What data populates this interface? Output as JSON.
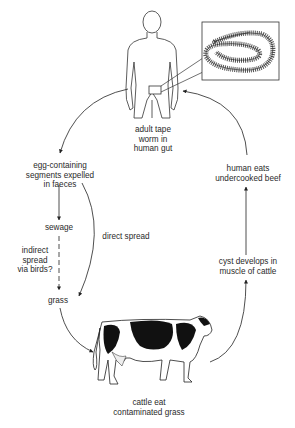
{
  "diagram": {
    "nodes": {
      "adult": {
        "lines": [
          "adult tape",
          "worm in",
          "human gut"
        ]
      },
      "segments": {
        "lines": [
          "egg-containing",
          "segments expelled",
          "in faeces"
        ]
      },
      "sewage": {
        "lines": [
          "sewage"
        ]
      },
      "indirect": {
        "lines": [
          "indirect",
          "spread",
          "via birds?"
        ]
      },
      "direct": {
        "lines": [
          "direct spread"
        ]
      },
      "grass": {
        "lines": [
          "grass"
        ]
      },
      "cattle": {
        "lines": [
          "cattle eat",
          "contaminated grass"
        ]
      },
      "cyst": {
        "lines": [
          "cyst develops in",
          "muscle of cattle"
        ]
      },
      "human_eats": {
        "lines": [
          "human eats",
          "undercooked beef"
        ]
      }
    },
    "illustrations": {
      "human": "human-figure",
      "inset": "tapeworm-magnified-inset",
      "cow": "holstein-cow"
    },
    "colors": {
      "ink": "#222222",
      "background": "#ffffff"
    }
  }
}
